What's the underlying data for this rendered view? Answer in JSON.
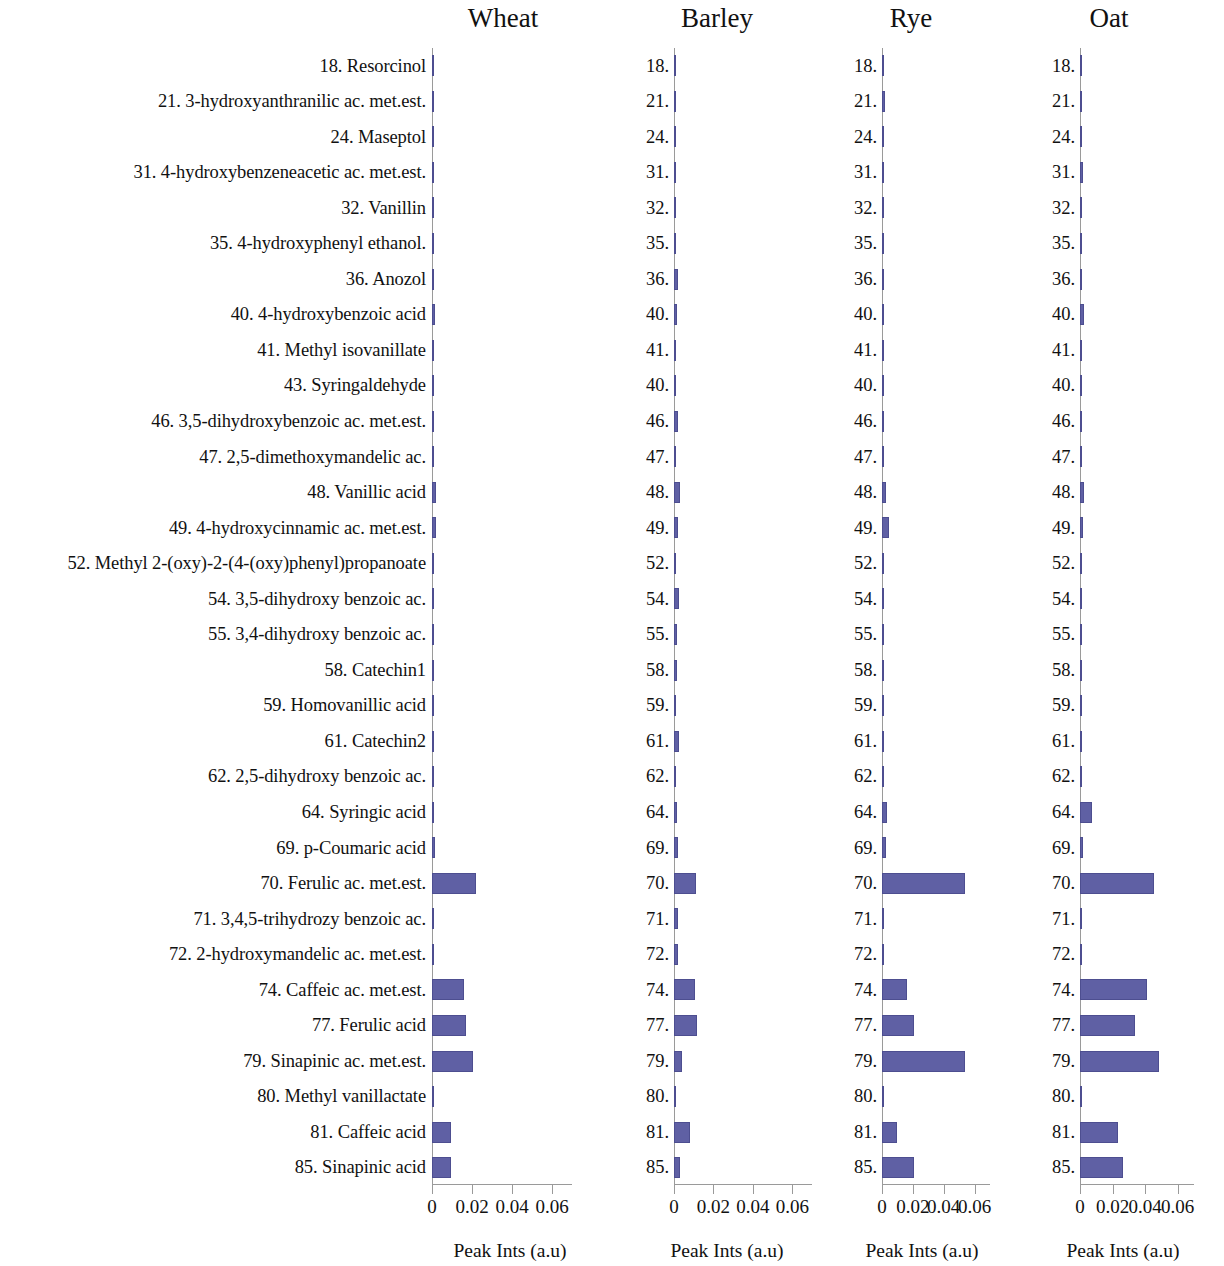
{
  "figure": {
    "bar_color": "#5f60a4",
    "axis_color": "#9a9a9a",
    "axis_caption": "Peak Ints (a.u)"
  },
  "panels": [
    {
      "title": "Wheat"
    },
    {
      "title": "Barley"
    },
    {
      "title": "Rye"
    },
    {
      "title": "Oat"
    }
  ],
  "row_labels": [
    "18. Resorcinol",
    "21. 3-hydroxyanthranilic ac. met.est.",
    "24. Maseptol",
    "31. 4-hydroxybenzeneacetic ac. met.est.",
    "32. Vanillin",
    "35. 4-hydroxyphenyl ethanol.",
    "36. Anozol",
    "40. 4-hydroxybenzoic acid",
    "41. Methyl isovanillate",
    "43. Syringaldehyde",
    "46. 3,5-dihydroxybenzoic ac. met.est.",
    "47. 2,5-dimethoxymandelic ac.",
    "48. Vanillic acid",
    "49. 4-hydroxycinnamic ac. met.est.",
    "52. Methyl 2-(oxy)-2-(4-(oxy)phenyl)propanoate",
    "54. 3,5-dihydroxy benzoic ac.",
    "55. 3,4-dihydroxy benzoic ac.",
    "58. Catechin1",
    "59. Homovanillic acid",
    "61. Catechin2",
    "62. 2,5-dihydroxy benzoic ac.",
    "64. Syringic acid",
    "69. p-Coumaric acid",
    "70. Ferulic ac. met.est.",
    "71. 3,4,5-trihydrozy benzoic ac.",
    "72. 2-hydroxymandelic ac. met.est.",
    "74. Caffeic ac. met.est.",
    "77. Ferulic acid",
    "79. Sinapinic ac. met.est.",
    "80. Methyl vanillactate",
    "81. Caffeic acid",
    "85. Sinapinic acid"
  ],
  "row_numbers": [
    "18.",
    "21.",
    "24.",
    "31.",
    "32.",
    "35.",
    "36.",
    "40.",
    "41.",
    "40.",
    "46.",
    "47.",
    "48.",
    "49.",
    "52.",
    "54.",
    "55.",
    "58.",
    "59.",
    "61.",
    "62.",
    "64.",
    "69.",
    "70.",
    "71.",
    "72.",
    "74.",
    "77.",
    "79.",
    "80.",
    "81.",
    "85."
  ],
  "chart_data": {
    "type": "bar",
    "title": "",
    "orientation": "horizontal",
    "xlabel": "Peak Ints (a.u)",
    "ylabel": "",
    "xlim": [
      0,
      0.07
    ],
    "xticks": [
      0,
      0.02,
      0.04,
      0.06
    ],
    "xticklabels": [
      "0",
      "0.02",
      "0.04",
      "0.06"
    ],
    "grid": false,
    "legend": "none",
    "panel_layout": "4 side-by-side horizontal bar panels sharing the same categories",
    "categories": [
      "18. Resorcinol",
      "21. 3-hydroxyanthranilic ac. met.est.",
      "24. Maseptol",
      "31. 4-hydroxybenzeneacetic ac. met.est.",
      "32. Vanillin",
      "35. 4-hydroxyphenyl ethanol.",
      "36. Anozol",
      "40. 4-hydroxybenzoic acid",
      "41. Methyl isovanillate",
      "43. Syringaldehyde",
      "46. 3,5-dihydroxybenzoic ac. met.est.",
      "47. 2,5-dimethoxymandelic ac.",
      "48. Vanillic acid",
      "49. 4-hydroxycinnamic ac. met.est.",
      "52. Methyl 2-(oxy)-2-(4-(oxy)phenyl)propanoate",
      "54. 3,5-dihydroxy benzoic ac.",
      "55. 3,4-dihydroxy benzoic ac.",
      "58. Catechin1",
      "59. Homovanillic acid",
      "61. Catechin2",
      "62. 2,5-dihydroxy benzoic ac.",
      "64. Syringic acid",
      "69. p-Coumaric acid",
      "70. Ferulic ac. met.est.",
      "71. 3,4,5-trihydrozy benzoic ac.",
      "72. 2-hydroxymandelic ac. met.est.",
      "74. Caffeic ac. met.est.",
      "77. Ferulic acid",
      "79. Sinapinic ac. met.est.",
      "80. Methyl vanillactate",
      "81. Caffeic acid",
      "85. Sinapinic acid"
    ],
    "series": [
      {
        "name": "Wheat",
        "values": [
          0.0012,
          0.0004,
          0.001,
          0.001,
          0.0009,
          0.0009,
          0.0008,
          0.0014,
          0.0006,
          0.0006,
          0.0009,
          0.0004,
          0.0018,
          0.0018,
          0.0006,
          0.0008,
          0.0007,
          0.0005,
          0.0004,
          0.001,
          0.0008,
          0.001,
          0.0013,
          0.0222,
          0.0007,
          0.0003,
          0.0158,
          0.0172,
          0.0205,
          0.0012,
          0.0097,
          0.0096
        ]
      },
      {
        "name": "Barley",
        "values": [
          0.0004,
          0.0004,
          0.0004,
          0.0008,
          0.0004,
          0.0009,
          0.0018,
          0.0016,
          0.0006,
          0.0004,
          0.0018,
          0.0012,
          0.003,
          0.0022,
          0.0006,
          0.0024,
          0.0016,
          0.0014,
          0.0004,
          0.0027,
          0.0005,
          0.0013,
          0.0018,
          0.0113,
          0.0022,
          0.0019,
          0.0104,
          0.0119,
          0.0042,
          0.0004,
          0.0082,
          0.003
        ]
      },
      {
        "name": "Rye",
        "values": [
          0.0011,
          0.0018,
          0.0005,
          0.0006,
          0.0006,
          0.0006,
          0.0013,
          0.0014,
          0.0003,
          0.0005,
          0.0012,
          0.0004,
          0.0024,
          0.0047,
          0.0006,
          0.0014,
          0.0003,
          0.0006,
          0.0005,
          0.0005,
          0.0006,
          0.003,
          0.0027,
          0.0535,
          0.0003,
          0.0003,
          0.0165,
          0.0208,
          0.0536,
          0.0011,
          0.0095,
          0.021
        ]
      },
      {
        "name": "Oat",
        "values": [
          0.0006,
          0.0004,
          0.0012,
          0.0016,
          0.0005,
          0.0006,
          0.0014,
          0.0026,
          0.0005,
          0.0004,
          0.0012,
          0.0004,
          0.0023,
          0.0021,
          0.0009,
          0.0007,
          0.0004,
          0.0007,
          0.0005,
          0.0006,
          0.0005,
          0.0074,
          0.002,
          0.0452,
          0.0003,
          0.0003,
          0.0412,
          0.0337,
          0.0487,
          0.0014,
          0.0235,
          0.0267
        ]
      }
    ]
  }
}
